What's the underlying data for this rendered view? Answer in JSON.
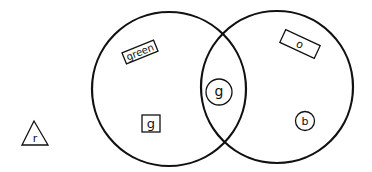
{
  "diagram": {
    "type": "venn",
    "background": "#ffffff",
    "stroke_color": "#111111",
    "circles": [
      {
        "name": "left-set",
        "cx": 169,
        "cy": 89,
        "r": 77
      },
      {
        "name": "right-set",
        "cx": 277,
        "cy": 87,
        "r": 76
      }
    ],
    "items": [
      {
        "name": "item-green-word",
        "shape": "rectangle",
        "label": "green",
        "region": "left-only",
        "x": 140,
        "y": 52,
        "rotation": -22
      },
      {
        "name": "item-g-square",
        "shape": "square",
        "label": "g",
        "region": "left-only",
        "x": 151,
        "y": 124
      },
      {
        "name": "item-g-circle",
        "shape": "circle",
        "label": "g",
        "region": "intersection",
        "x": 219,
        "y": 92
      },
      {
        "name": "item-o-rectangle",
        "shape": "rectangle",
        "label": "o",
        "region": "right-only",
        "x": 300,
        "y": 44,
        "rotation": 25
      },
      {
        "name": "item-b-circle",
        "shape": "circle",
        "label": "b",
        "region": "right-only",
        "x": 305,
        "y": 121
      },
      {
        "name": "item-r-triangle",
        "shape": "triangle",
        "label": "r",
        "region": "outside",
        "x": 34,
        "y": 134
      }
    ]
  }
}
